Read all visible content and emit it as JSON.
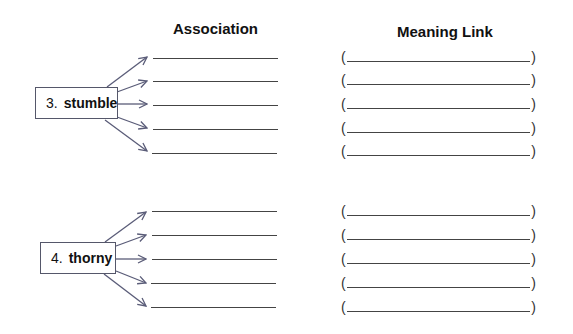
{
  "headers": {
    "association": "Association",
    "meaning_link": "Meaning Link"
  },
  "items": [
    {
      "number": "3.",
      "word": "stumble",
      "association_blanks": 5,
      "meaning_blanks": 5
    },
    {
      "number": "4.",
      "word": "thorny",
      "association_blanks": 5,
      "meaning_blanks": 5
    }
  ],
  "brackets": {
    "open": "(",
    "close": ")"
  },
  "colors": {
    "arrow": "#5a5c78",
    "line": "#444444"
  }
}
